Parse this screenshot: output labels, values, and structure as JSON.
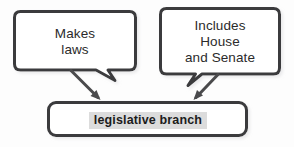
{
  "diagram": {
    "title_text": "legislative branch",
    "nodes": [
      {
        "id": "makes-laws",
        "shape": "rounded-callout",
        "lines": [
          "Makes",
          "laws"
        ],
        "bbox": [
          14,
          11,
          122,
          61
        ]
      },
      {
        "id": "includes-house-senate",
        "shape": "rounded-callout",
        "lines": [
          "Includes",
          "House",
          "and Senate"
        ],
        "bbox": [
          160,
          8,
          120,
          68
        ]
      },
      {
        "id": "legislative-branch",
        "shape": "rounded-rect",
        "lines": [
          "legislative branch"
        ],
        "bbox": [
          48,
          102,
          200,
          35
        ]
      }
    ],
    "edges": [
      {
        "id": "edge-makes-laws-to-branch",
        "from": "makes-laws",
        "to": "legislative-branch",
        "style": "arrow"
      },
      {
        "id": "edge-includes-to-branch",
        "from": "includes-house-senate",
        "to": "legislative-branch",
        "style": "arrow"
      }
    ],
    "colors": {
      "background": "#fdfdfd",
      "box_fill": "#ffffff",
      "box_stroke": "#3a3a3c",
      "text": "#2b2b2b",
      "highlight_fill": "#dcdcdc",
      "highlight_text": "#1c1c1c",
      "arrow": "#4a4a4c",
      "shadow": "#c9c9c9"
    }
  },
  "labels": {
    "makes_line1": "Makes",
    "makes_line2": "laws",
    "includes_line1": "Includes",
    "includes_line2": "House",
    "includes_line3": "and Senate",
    "branch_label": "legislative branch"
  }
}
